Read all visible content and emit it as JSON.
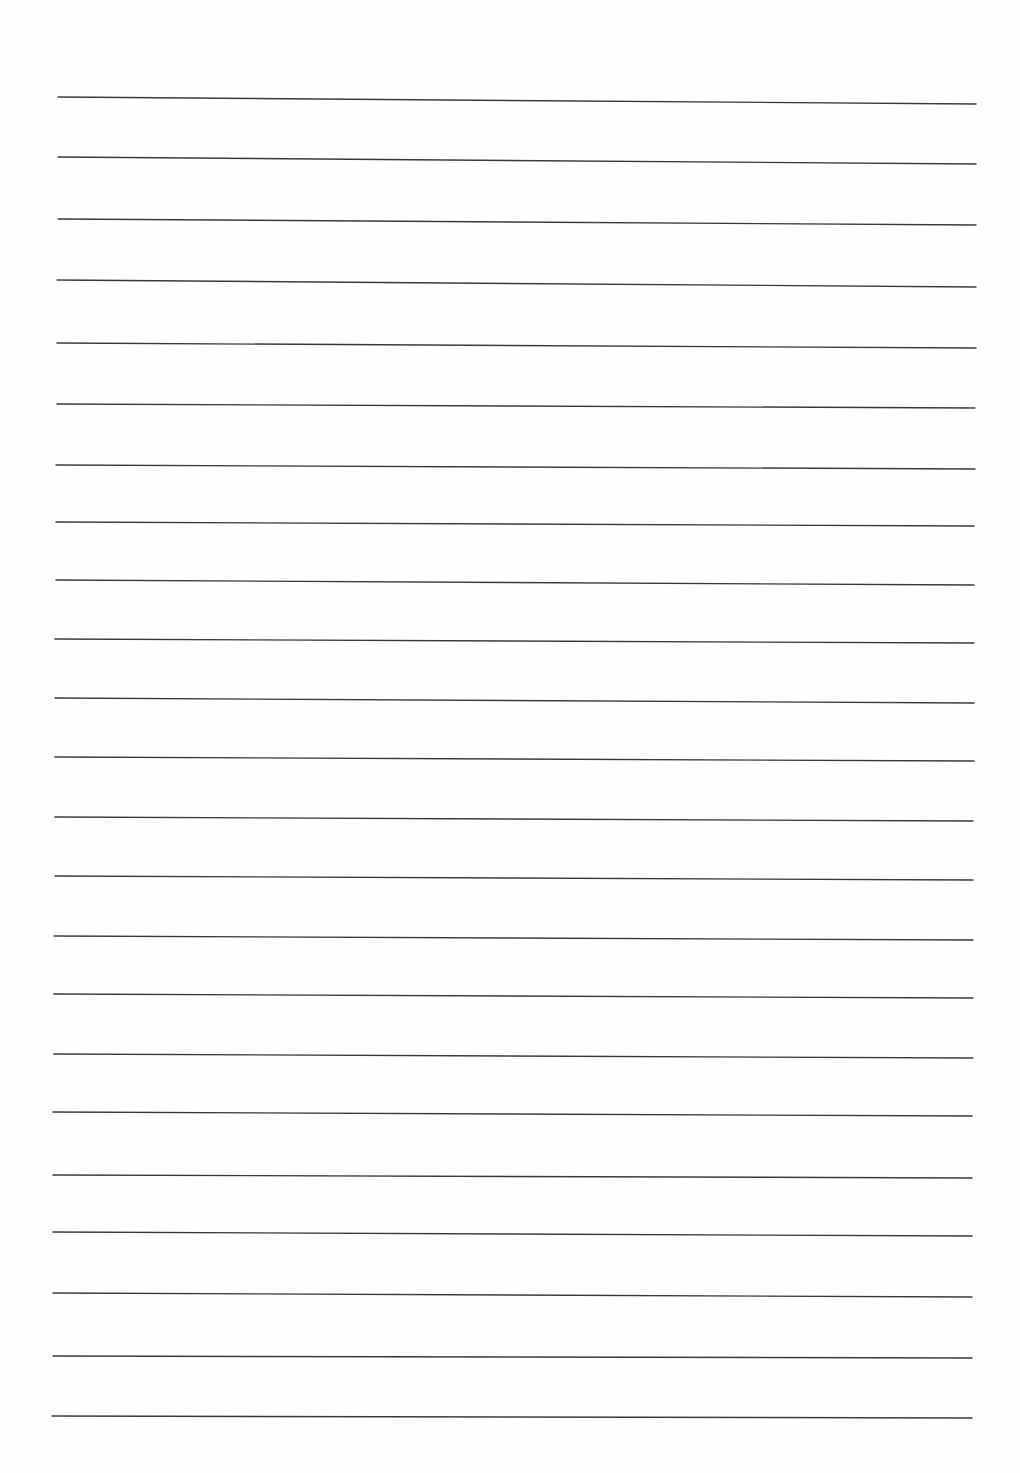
{
  "page": {
    "type": "blank-lined-paper",
    "width": 1020,
    "height": 1473,
    "background": "#fefefe",
    "line_color": "#3a3a3a",
    "line_count": 23
  },
  "rules": [
    {
      "x1": 58,
      "y1": 97,
      "x2": 976,
      "y2": 104
    },
    {
      "x1": 58,
      "y1": 157,
      "x2": 976,
      "y2": 164
    },
    {
      "x1": 58,
      "y1": 219,
      "x2": 976,
      "y2": 225
    },
    {
      "x1": 57,
      "y1": 280,
      "x2": 976,
      "y2": 287
    },
    {
      "x1": 57,
      "y1": 343,
      "x2": 976,
      "y2": 348
    },
    {
      "x1": 57,
      "y1": 404,
      "x2": 975,
      "y2": 408
    },
    {
      "x1": 56,
      "y1": 465,
      "x2": 975,
      "y2": 469
    },
    {
      "x1": 56,
      "y1": 522,
      "x2": 974,
      "y2": 526
    },
    {
      "x1": 56,
      "y1": 580,
      "x2": 974,
      "y2": 585
    },
    {
      "x1": 55,
      "y1": 639,
      "x2": 974,
      "y2": 643
    },
    {
      "x1": 55,
      "y1": 698,
      "x2": 974,
      "y2": 703
    },
    {
      "x1": 55,
      "y1": 757,
      "x2": 974,
      "y2": 761
    },
    {
      "x1": 55,
      "y1": 817,
      "x2": 973,
      "y2": 821
    },
    {
      "x1": 55,
      "y1": 876,
      "x2": 973,
      "y2": 880
    },
    {
      "x1": 54,
      "y1": 936,
      "x2": 973,
      "y2": 940
    },
    {
      "x1": 54,
      "y1": 994,
      "x2": 973,
      "y2": 998
    },
    {
      "x1": 54,
      "y1": 1054,
      "x2": 973,
      "y2": 1058
    },
    {
      "x1": 53,
      "y1": 1112,
      "x2": 972,
      "y2": 1116
    },
    {
      "x1": 53,
      "y1": 1175,
      "x2": 972,
      "y2": 1178
    },
    {
      "x1": 53,
      "y1": 1232,
      "x2": 972,
      "y2": 1236
    },
    {
      "x1": 53,
      "y1": 1293,
      "x2": 972,
      "y2": 1297
    },
    {
      "x1": 53,
      "y1": 1356,
      "x2": 972,
      "y2": 1358
    },
    {
      "x1": 52,
      "y1": 1416,
      "x2": 972,
      "y2": 1418
    }
  ]
}
